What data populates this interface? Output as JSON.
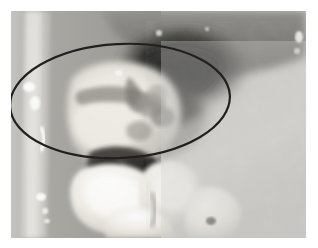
{
  "image": {
    "kind": "clinical-intraoral-photograph",
    "modality": "grayscale photograph",
    "subject": "posterior mandibular dentition and buccal mucosa",
    "caption_text": "",
    "background_color": "#ffffff",
    "plate": {
      "x": 11,
      "y": 11,
      "width": 295,
      "height": 227,
      "border": "none",
      "base_tone": "#8d8d8d"
    },
    "annotation": {
      "shape": "ellipse",
      "label": "region-of-interest",
      "stroke_color": "#0a0a0a",
      "stroke_width_px": 2,
      "fill": "none",
      "center_x": 120,
      "center_y": 101,
      "radius_x": 110,
      "radius_y": 57,
      "rotation_deg": -3
    },
    "regions": [
      {
        "name": "cheek-retractor-strip",
        "tone": "#d8d6d2",
        "position": "left edge vertical band"
      },
      {
        "name": "buccal-mucosa-left",
        "tone": "#9a9894",
        "position": "left of teeth"
      },
      {
        "name": "vestibule-shadow",
        "tone": "#1b1b1b",
        "position": "upper center-right dark recess"
      },
      {
        "name": "buccal-mucosa-right",
        "tone": "#c9c7c3",
        "position": "right half, mottled"
      },
      {
        "name": "gingiva-lesion-mass",
        "tone": "#e4e1da",
        "position": "center, within ellipse"
      },
      {
        "name": "molar-teeth",
        "tone": "#f2efe8",
        "position": "lower center"
      },
      {
        "name": "interdental-dark-areas",
        "tone": "#2a2723",
        "position": "between teeth, lower center"
      },
      {
        "name": "saliva-highlights",
        "tone": "#ffffff",
        "position": "scattered specular spots"
      }
    ],
    "palette": {
      "white": "#ffffff",
      "tooth_white": "#f5f2ec",
      "gingiva_light": "#e2dfd8",
      "mucosa_mid": "#a8a6a1",
      "mucosa_light": "#c8c6c2",
      "shadow_dark": "#1a1a1a",
      "annotation_black": "#0a0a0a"
    }
  }
}
